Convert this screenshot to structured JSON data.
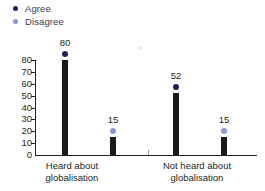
{
  "legend": {
    "position": "top-left",
    "items": [
      {
        "label": "Agree",
        "color": "#1f2060",
        "marker": "legend-dot-agree"
      },
      {
        "label": "Disagree",
        "color": "#8b95d6",
        "marker": "legend-dot-disagree"
      }
    ]
  },
  "chart_data": {
    "type": "bar",
    "title": "",
    "subtitle": "",
    "xlabel": "",
    "ylabel": "",
    "ylim": [
      0,
      80
    ],
    "yticks": [
      0,
      10,
      20,
      30,
      40,
      50,
      60,
      70,
      80
    ],
    "ytick_labels": [
      "0",
      "10",
      "20",
      "30",
      "40",
      "50",
      "60",
      "70",
      "80"
    ],
    "grid": false,
    "legend_position": "top-left",
    "categories": [
      "Heard about globalisation",
      "Not heard about globalisation"
    ],
    "category_lines": [
      [
        "Heard about",
        "globalisation"
      ],
      [
        "Not heard about",
        "globalisation"
      ]
    ],
    "series": [
      {
        "name": "Agree",
        "color": "#1f2060",
        "values": [
          80,
          52
        ]
      },
      {
        "name": "Disagree",
        "color": "#8b95d6",
        "values": [
          15,
          15
        ]
      }
    ],
    "bars": [
      {
        "id": "heard-agree",
        "group": "Heard about globalisation",
        "series": "Agree",
        "value": 80,
        "label": "80",
        "marker_color": "#1f2060",
        "x": 62
      },
      {
        "id": "heard-disagree",
        "group": "Heard about globalisation",
        "series": "Disagree",
        "value": 15,
        "label": "15",
        "marker_color": "#8b95d6",
        "x": 110
      },
      {
        "id": "notheard-agree",
        "group": "Not heard about globalisation",
        "series": "Agree",
        "value": 52,
        "label": "52",
        "marker_color": "#1f2060",
        "x": 173
      },
      {
        "id": "notheard-disagree",
        "group": "Not heard about globalisation",
        "series": "Disagree",
        "value": 15,
        "label": "15",
        "marker_color": "#8b95d6",
        "x": 221
      }
    ],
    "bar_color": "#1a1a1a"
  }
}
